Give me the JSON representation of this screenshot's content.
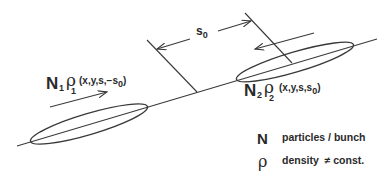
{
  "diagram": {
    "bunch1": {
      "symbol": "N",
      "index": "1",
      "density_symbol": "ρ",
      "density_index": "1",
      "args": "(x,y,s,−s",
      "args_sub": "0",
      "args_close": ")"
    },
    "bunch2": {
      "symbol": "N",
      "index": "2",
      "density_symbol": "ρ",
      "density_index": "2",
      "args": "(x,y,s,s",
      "args_sub": "0",
      "args_close": ")"
    },
    "separation": {
      "symbol": "s",
      "sub": "0"
    },
    "legend": [
      {
        "symbol": "N",
        "text": "particles / bunch"
      },
      {
        "symbol": "ρ",
        "text": "density  ≠ const."
      }
    ],
    "colors": {
      "stroke": "#3a3a3a",
      "text": "#2a2a2a",
      "background": "#ffffff"
    }
  }
}
